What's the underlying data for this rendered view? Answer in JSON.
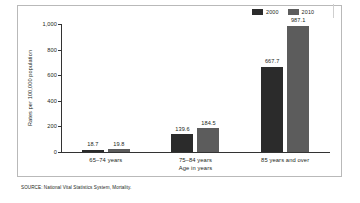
{
  "chart_data": {
    "type": "bar",
    "title": "",
    "categories": [
      "65–74 years",
      "75–84 years",
      "85 years and over"
    ],
    "series": [
      {
        "name": "2000",
        "color": "#2b2b2b",
        "values": [
          18.7,
          139.6,
          667.7
        ],
        "labels": [
          "18.7",
          "139.6",
          "667.7"
        ]
      },
      {
        "name": "2010",
        "color": "#5c5c5c",
        "values": [
          19.8,
          184.5,
          987.1
        ],
        "labels": [
          "19.8",
          "184.5",
          "987.1"
        ]
      }
    ],
    "xlabel": "Age in years",
    "ylabel": "Rates per 100,000 population",
    "ylim": [
      0,
      1000
    ],
    "yticks": [
      0,
      200,
      400,
      600,
      800,
      1000
    ],
    "ytick_labels": [
      "0",
      "200",
      "400",
      "600",
      "800",
      "1,000"
    ],
    "grid": false,
    "legend_position": "top-right"
  },
  "legend": {
    "entries": [
      {
        "label": "2000"
      },
      {
        "label": "2010"
      }
    ]
  },
  "source": {
    "text": "SOURCE: National Vital Statistics System, Mortality."
  }
}
